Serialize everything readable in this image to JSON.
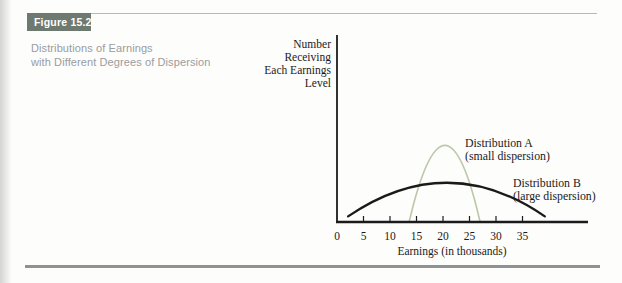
{
  "figure": {
    "label": "Figure 15.2",
    "label_bg": "#6e7a70",
    "label_color": "#ffffff",
    "caption_line1": "Distributions of Earnings",
    "caption_line2": "with Different Degrees of Dispersion",
    "caption_color": "#9a9c9e"
  },
  "chart_data": {
    "type": "line",
    "title": "",
    "xlabel": "Earnings (in thousands)",
    "ylabel": "Number Receiving Each Earnings Level",
    "ylabel_lines": [
      "Number",
      "Receiving",
      "Each Earnings",
      "Level"
    ],
    "x_ticks": [
      0,
      5,
      10,
      15,
      20,
      25,
      30,
      35
    ],
    "xlim": [
      0,
      47.4
    ],
    "ylim": [
      0,
      1
    ],
    "grid": false,
    "legend_position": "inline-annotations",
    "axis_color": "#1b1b1b",
    "series": [
      {
        "name": "Distribution A",
        "sublabel": "(small dispersion)",
        "color": "#bdc8aa",
        "shape": "bell",
        "x_start": 13.6,
        "x_end": 27.0,
        "peak_x": 20.4,
        "peak_height": 0.41,
        "end_height": 0
      },
      {
        "name": "Distribution B",
        "sublabel": "(large dispersion)",
        "color": "#1a1a1a",
        "shape": "bell",
        "x_start": 2.1,
        "x_end": 39.2,
        "peak_x": 20.8,
        "peak_height": 0.21,
        "end_height": 0.03
      }
    ],
    "annotations": [
      {
        "series": "Distribution A",
        "lines": [
          "Distribution A",
          "(small dispersion)"
        ]
      },
      {
        "series": "Distribution B",
        "lines": [
          "Distribution B",
          "(large dispersion)"
        ]
      }
    ]
  }
}
